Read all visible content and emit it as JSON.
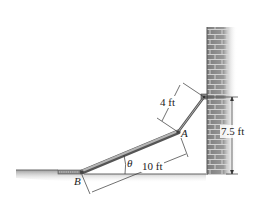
{
  "figure": {
    "labels": {
      "point_a": "A",
      "point_b": "B",
      "angle": "θ",
      "dim_short_member": "4 ft",
      "dim_long_member": "10 ft",
      "dim_height": "7.5 ft"
    },
    "colors": {
      "wall_fill": "#8a8a8a",
      "wall_mortar": "#d8d8d8",
      "ground": "#b9b9b9",
      "member": "#7a7a7a",
      "dimension_line": "#333333"
    },
    "elements": [
      "brick wall",
      "ground",
      "long member AB",
      "short member from A to wall",
      "roller support at B",
      "pin at wall"
    ]
  }
}
